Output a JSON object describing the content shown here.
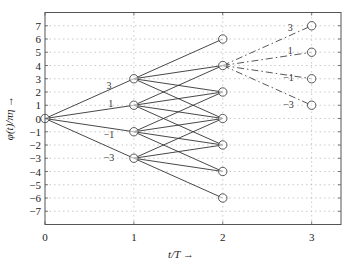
{
  "chart_data": {
    "type": "line",
    "title": "",
    "xlabel": "t/T →",
    "ylabel": "φ(t)/πη →",
    "xlim": [
      0,
      3.33
    ],
    "ylim": [
      -8,
      8
    ],
    "xticks": [
      0,
      1,
      2,
      3
    ],
    "yticks": [
      -7,
      -6,
      -5,
      -4,
      -3,
      -2,
      -1,
      0,
      1,
      2,
      3,
      4,
      5,
      6,
      7
    ],
    "grid": "dotted",
    "nodes": [
      {
        "t": 0,
        "phi": 0
      },
      {
        "t": 1,
        "phi": 3
      },
      {
        "t": 1,
        "phi": 1
      },
      {
        "t": 1,
        "phi": -1
      },
      {
        "t": 1,
        "phi": -3
      },
      {
        "t": 2,
        "phi": 6
      },
      {
        "t": 2,
        "phi": 4
      },
      {
        "t": 2,
        "phi": 2
      },
      {
        "t": 2,
        "phi": 0
      },
      {
        "t": 2,
        "phi": -2
      },
      {
        "t": 2,
        "phi": -4
      },
      {
        "t": 2,
        "phi": -6
      },
      {
        "t": 3,
        "phi": 7
      },
      {
        "t": 3,
        "phi": 5
      },
      {
        "t": 3,
        "phi": 3
      },
      {
        "t": 3,
        "phi": 1
      }
    ],
    "series": [
      {
        "name": "solid-transitions",
        "style": "solid",
        "edges": [
          [
            [
              0,
              0
            ],
            [
              1,
              3
            ]
          ],
          [
            [
              0,
              0
            ],
            [
              1,
              1
            ]
          ],
          [
            [
              0,
              0
            ],
            [
              1,
              -1
            ]
          ],
          [
            [
              0,
              0
            ],
            [
              1,
              -3
            ]
          ],
          [
            [
              1,
              3
            ],
            [
              2,
              6
            ]
          ],
          [
            [
              1,
              3
            ],
            [
              2,
              4
            ]
          ],
          [
            [
              1,
              3
            ],
            [
              2,
              2
            ]
          ],
          [
            [
              1,
              3
            ],
            [
              2,
              0
            ]
          ],
          [
            [
              1,
              1
            ],
            [
              2,
              4
            ]
          ],
          [
            [
              1,
              1
            ],
            [
              2,
              2
            ]
          ],
          [
            [
              1,
              1
            ],
            [
              2,
              0
            ]
          ],
          [
            [
              1,
              1
            ],
            [
              2,
              -2
            ]
          ],
          [
            [
              1,
              -1
            ],
            [
              2,
              2
            ]
          ],
          [
            [
              1,
              -1
            ],
            [
              2,
              0
            ]
          ],
          [
            [
              1,
              -1
            ],
            [
              2,
              -2
            ]
          ],
          [
            [
              1,
              -1
            ],
            [
              2,
              -4
            ]
          ],
          [
            [
              1,
              -3
            ],
            [
              2,
              0
            ]
          ],
          [
            [
              1,
              -3
            ],
            [
              2,
              -2
            ]
          ],
          [
            [
              1,
              -3
            ],
            [
              2,
              -4
            ]
          ],
          [
            [
              1,
              -3
            ],
            [
              2,
              -6
            ]
          ]
        ]
      },
      {
        "name": "dashdot-transitions",
        "style": "dashdot",
        "edges": [
          [
            [
              2,
              4
            ],
            [
              3,
              7
            ]
          ],
          [
            [
              2,
              4
            ],
            [
              3,
              5
            ]
          ],
          [
            [
              2,
              4
            ],
            [
              3,
              3
            ]
          ],
          [
            [
              2,
              4
            ],
            [
              3,
              1
            ]
          ]
        ]
      }
    ],
    "annotations": [
      {
        "text": "3",
        "t": 0.72,
        "phi": 2.2
      },
      {
        "text": "1",
        "t": 0.74,
        "phi": 0.9
      },
      {
        "text": "-1",
        "t": 0.72,
        "phi": -1.5
      },
      {
        "text": "-3",
        "t": 0.72,
        "phi": -3.2
      },
      {
        "text": "3",
        "t": 2.76,
        "phi": 6.6
      },
      {
        "text": "1",
        "t": 2.76,
        "phi": 4.9
      },
      {
        "text": "-1",
        "t": 2.74,
        "phi": 2.8
      },
      {
        "text": "-3",
        "t": 2.74,
        "phi": 0.8
      }
    ]
  }
}
